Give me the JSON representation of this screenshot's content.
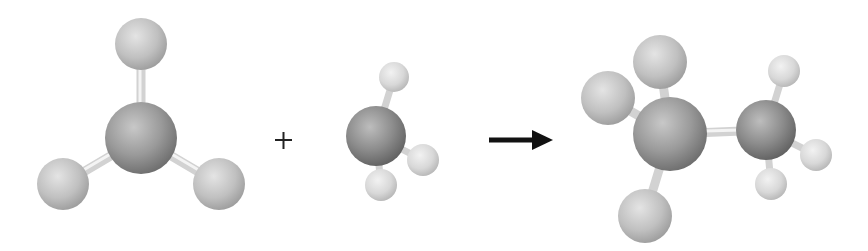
{
  "diagram": {
    "operator": "+",
    "arrow": "reaction-arrow",
    "colors": {
      "large_atom": "#9a9a9a",
      "large_atom_dark": "#6e6e6e",
      "medium_atom": "#c4c4c4",
      "small_atom": "#dcdcdc",
      "bond": "#d6d6d6",
      "operator": "#222222",
      "arrow": "#111111"
    },
    "reactant_1": {
      "name": "trigonal-planar-fragment",
      "center": {
        "x": 141,
        "y": 138,
        "r": 36
      },
      "substituents": [
        {
          "x": 141,
          "y": 44,
          "r": 26
        },
        {
          "x": 63,
          "y": 184,
          "r": 26
        },
        {
          "x": 219,
          "y": 184,
          "r": 26
        }
      ]
    },
    "reactant_2": {
      "name": "methyl-group",
      "center": {
        "x": 376,
        "y": 136,
        "r": 30
      },
      "substituents": [
        {
          "x": 394,
          "y": 77,
          "r": 15
        },
        {
          "x": 423,
          "y": 160,
          "r": 16
        },
        {
          "x": 381,
          "y": 185,
          "r": 16
        }
      ]
    },
    "product": {
      "name": "combined-product",
      "center_large": {
        "x": 670,
        "y": 134,
        "r": 37
      },
      "large_substituents": [
        {
          "x": 660,
          "y": 62,
          "r": 27
        },
        {
          "x": 608,
          "y": 98,
          "r": 27
        },
        {
          "x": 645,
          "y": 216,
          "r": 27
        }
      ],
      "center_small": {
        "x": 766,
        "y": 130,
        "r": 30
      },
      "small_substituents": [
        {
          "x": 784,
          "y": 71,
          "r": 16
        },
        {
          "x": 816,
          "y": 155,
          "r": 16
        },
        {
          "x": 771,
          "y": 184,
          "r": 16
        }
      ]
    }
  }
}
